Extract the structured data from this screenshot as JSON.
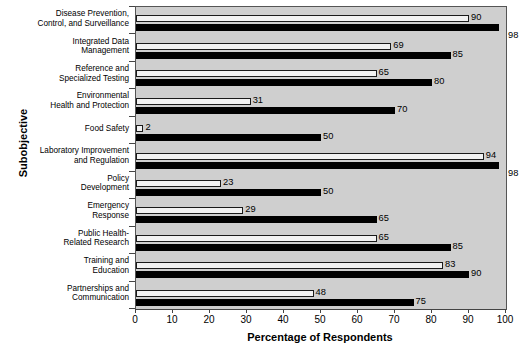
{
  "chart_data": {
    "type": "bar",
    "orientation": "horizontal",
    "title": "",
    "xlabel": "Percentage of Respondents",
    "ylabel": "Subobjective",
    "xlim": [
      0,
      100
    ],
    "xticks": [
      0,
      10,
      20,
      30,
      40,
      50,
      60,
      70,
      80,
      90,
      100
    ],
    "grid": false,
    "legend": null,
    "categories": [
      "Disease Prevention, Control, and Surveillance",
      "Integrated Data Management",
      "Reference and Specialized Testing",
      "Environmental Health and Protection",
      "Food Safety",
      "Laboratory Improvement and Regulation",
      "Policy Development",
      "Emergency Response",
      "Public Health-Related Research",
      "Training and Education",
      "Partnerships and Communication"
    ],
    "category_lines": [
      [
        "Disease Prevention,",
        "Control, and Surveillance"
      ],
      [
        "Integrated Data",
        "Management"
      ],
      [
        "Reference and",
        "Specialized Testing"
      ],
      [
        "Environmental",
        "Health and Protection"
      ],
      [
        "Food Safety"
      ],
      [
        "Laboratory Improvement",
        "and Regulation"
      ],
      [
        "Policy",
        "Development"
      ],
      [
        "Emergency",
        "Response"
      ],
      [
        "Public Health-",
        "Related Research"
      ],
      [
        "Training and",
        "Education"
      ],
      [
        "Partnerships and",
        "Communication"
      ]
    ],
    "series": [
      {
        "name": "series-a",
        "style": "white-outlined",
        "color": "#f2f2f2",
        "values": [
          90,
          69,
          65,
          31,
          2,
          94,
          23,
          29,
          65,
          83,
          48
        ]
      },
      {
        "name": "series-b",
        "style": "solid-black",
        "color": "#000000",
        "values": [
          98,
          85,
          80,
          70,
          50,
          98,
          50,
          65,
          85,
          90,
          75
        ]
      }
    ]
  },
  "axis": {
    "x_title": "Percentage of Respondents",
    "y_title": "Subobjective",
    "x_tick_labels": [
      "0",
      "10",
      "20",
      "30",
      "40",
      "50",
      "60",
      "70",
      "80",
      "90",
      "100"
    ]
  },
  "colors": {
    "plot_background": "#cfcfcf",
    "series_a": "#f2f2f2",
    "series_b": "#000000",
    "axis": "#444444",
    "text": "#000000"
  }
}
